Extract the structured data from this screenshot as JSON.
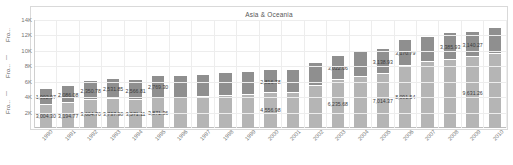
{
  "chart_data": {
    "type": "bar",
    "title": "Asia & Oceania",
    "xlabel": "",
    "ylabel": "Fro...  |  Fro...  |  Fro...",
    "ylim": [
      0,
      14000
    ],
    "ytick_labels": [
      "14K",
      "12K",
      "10K",
      "8K",
      "6K",
      "4K",
      "2K"
    ],
    "ytick_values": [
      14000,
      12000,
      10000,
      8000,
      6000,
      4000,
      2000
    ],
    "grid": true,
    "legend_position": "none",
    "stacked": true,
    "categories": [
      "1990",
      "1991",
      "1992",
      "1993",
      "1994",
      "1995",
      "1996",
      "1997",
      "1998",
      "1999",
      "2000",
      "2001",
      "2002",
      "2003",
      "2004",
      "2005",
      "2006",
      "2007",
      "2008",
      "2009",
      "2010"
    ],
    "series": [
      {
        "name": "lower-segment",
        "color": "#b5b5b5",
        "values": [
          3004.3,
          3194.77,
          3604.7,
          3737.98,
          3571.11,
          3871.36,
          3871.36,
          4010.0,
          4120.0,
          4260.0,
          4556.98,
          4556.98,
          5400.0,
          6235.68,
          6600.0,
          7014.37,
          8091.54,
          8500.0,
          8800.0,
          9200.0,
          9631.26
        ]
      },
      {
        "name": "upper-segment",
        "color": "#8f8f8f",
        "values": [
          1902.97,
          2086.08,
          2350.78,
          2531.85,
          2566.81,
          2769.3,
          2769.3,
          2790.0,
          2830.0,
          2900.0,
          2816.78,
          2816.78,
          2950.0,
          3022.06,
          3100.0,
          3138.93,
          3170.79,
          3200.0,
          3385.93,
          3140.27,
          3140.27
        ]
      }
    ],
    "top_labels": [
      "1,902.97",
      "2,086.08",
      "2,350.78",
      "2,531.85",
      "2,566.81",
      "2,769.30",
      "",
      "",
      "",
      "",
      "2,816.78",
      "",
      "",
      "3,022.06",
      "",
      "3,138.93",
      "3,170.79",
      "",
      "3,385.93",
      "3,140.27",
      ""
    ],
    "bottom_labels": [
      "3,004.30",
      "3,194.77",
      "3,604.70",
      "3,737.98",
      "3,571.11",
      "3,871.36",
      "",
      "",
      "",
      "",
      "4,556.98",
      "",
      "",
      "6,235.68",
      "",
      "7,014.37",
      "8,091.54",
      "",
      "",
      "9,631.26",
      ""
    ]
  },
  "colors": {
    "upper_segment": "#8f8f8f",
    "lower_segment": "#b5b5b5",
    "frame": "#d9d9d9",
    "grid": "#ededed",
    "text": "#777777"
  }
}
